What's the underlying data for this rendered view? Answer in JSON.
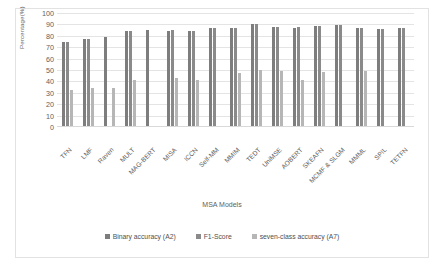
{
  "chart_data": {
    "type": "bar",
    "title": "",
    "xlabel": "MSA  Models",
    "ylabel": "Percentage(%)",
    "ylim": [
      0,
      100
    ],
    "yticks": [
      100,
      90,
      80,
      70,
      60,
      50,
      40,
      30,
      20,
      10,
      0
    ],
    "grid": true,
    "legend_position": "bottom",
    "categories": [
      "TFN",
      "LMF",
      "Raven",
      "MULT",
      "MAG-BERT",
      "MISA",
      "ICCN",
      "Self-MM",
      "MMIM",
      "TEDT",
      "UniMSE",
      "AOBERT",
      "SKEAFN",
      "MCMF & SLGM",
      "MMML",
      "SPIL",
      "TETFN"
    ],
    "series": [
      {
        "name": "Binary accuracy (A2)",
        "color": "#7d7d7d",
        "values": [
          74,
          76,
          78,
          83,
          84.5,
          83.5,
          83.5,
          86,
          86,
          89.5,
          87,
          86,
          87.5,
          88.5,
          86,
          85.5,
          86
        ]
      },
      {
        "name": "F1-Score",
        "color": "#8a8a8a",
        "values": [
          74,
          76.5,
          null,
          83,
          null,
          84,
          83.5,
          86,
          86,
          89.8,
          87,
          86.5,
          87.5,
          88.5,
          86,
          85.5,
          86
        ]
      },
      {
        "name": "seven-class accuracy (A7)",
        "color": "#b6b6b6",
        "values": [
          32,
          33,
          33.5,
          40.5,
          null,
          42.5,
          40,
          null,
          46.5,
          49.5,
          48.5,
          40.5,
          47.5,
          null,
          48.5,
          null,
          null
        ]
      }
    ]
  },
  "legend": {
    "items": [
      {
        "label": "Binary accuracy (A2)"
      },
      {
        "label": "F1-Score"
      },
      {
        "label": "seven-class accuracy (A7)"
      }
    ]
  }
}
